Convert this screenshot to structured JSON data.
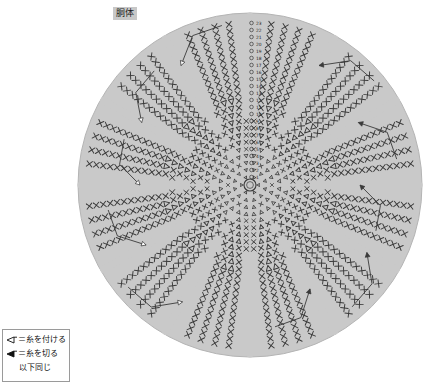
{
  "title": {
    "label": "胴体"
  },
  "legend": {
    "items": [
      {
        "symbol": "attach-yarn-arrow",
        "glyph": "◁",
        "text": "＝糸を付ける"
      },
      {
        "symbol": "cut-yarn-arrow",
        "glyph": "◀",
        "text": "＝糸を切る"
      }
    ],
    "note": "以下同じ"
  },
  "chart_data": {
    "type": "diagram",
    "diagram_kind": "crochet-round-chart",
    "title": "胴体",
    "center": {
      "x": 250,
      "y": 185
    },
    "outer_radius": 172,
    "colors": {
      "circle_fill": "#c9c9c9",
      "circle_edge": "#b4b4b4",
      "stitch": "#3a3a3a",
      "label_text": "#222222",
      "background": "#ffffff",
      "legend_border": "#9a9a9a"
    },
    "wedges": 12,
    "rounds_total": 23,
    "round_numbers": [
      1,
      2,
      3,
      4,
      5,
      6,
      7,
      8,
      9,
      10,
      11,
      12,
      13,
      14,
      15,
      16,
      17,
      18,
      19,
      20,
      21,
      22,
      23
    ],
    "round_radii": [
      8,
      15,
      22,
      29,
      36,
      43,
      50,
      57,
      64,
      71,
      78,
      85,
      92,
      99,
      106,
      113,
      120,
      127,
      134,
      141,
      148,
      155,
      162
    ],
    "round_stitch_counts": [
      6,
      12,
      18,
      24,
      30,
      36,
      42,
      48,
      54,
      60,
      66,
      72,
      72,
      72,
      72,
      72,
      72,
      72,
      72,
      72,
      72,
      72,
      72
    ],
    "increase_rounds": [
      1,
      2,
      3,
      4,
      5,
      6,
      7,
      8,
      9,
      10,
      11,
      12
    ],
    "plain_rounds": [
      13,
      14,
      15,
      16,
      17,
      18,
      19,
      20,
      21,
      22,
      23
    ],
    "stitch_symbol": "×",
    "stitch_symbol_name": "single-crochet",
    "increase_symbol_name": "increase-v",
    "center_ring_radius": 6,
    "label_column_angle_deg": -90,
    "markers": [
      {
        "type": "attach",
        "angle_deg": 150,
        "radius": 120
      },
      {
        "type": "attach",
        "angle_deg": 120,
        "radius": 135
      },
      {
        "type": "cut",
        "angle_deg": 30,
        "radius": 135
      },
      {
        "type": "cut",
        "angle_deg": 60,
        "radius": 120
      },
      {
        "type": "attach",
        "angle_deg": 180,
        "radius": 110
      },
      {
        "type": "cut",
        "angle_deg": 0,
        "radius": 110
      },
      {
        "type": "attach",
        "angle_deg": 210,
        "radius": 125
      },
      {
        "type": "cut",
        "angle_deg": 330,
        "radius": 125
      },
      {
        "type": "attach",
        "angle_deg": 240,
        "radius": 138
      },
      {
        "type": "cut",
        "angle_deg": 300,
        "radius": 138
      }
    ]
  }
}
